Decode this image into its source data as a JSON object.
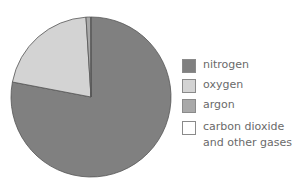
{
  "chart_data": {
    "type": "pie",
    "title": "",
    "categories": [
      "nitrogen",
      "oxygen",
      "argon",
      "carbon dioxide and other gases"
    ],
    "values": [
      78,
      21,
      0.9,
      0.1
    ],
    "colors": [
      "#808080",
      "#d3d3d3",
      "#a9a9a9",
      "#ffffff"
    ],
    "start_angle_deg": 0,
    "direction": "clockwise",
    "legend_position": "right"
  },
  "legend": {
    "items": [
      {
        "label": "nitrogen",
        "color": "#808080"
      },
      {
        "label": "oxygen",
        "color": "#d3d3d3"
      },
      {
        "label": "argon",
        "color": "#a9a9a9"
      },
      {
        "label_line1": "carbon dioxide",
        "label_line2": "and other gases",
        "color": "#ffffff"
      }
    ]
  }
}
